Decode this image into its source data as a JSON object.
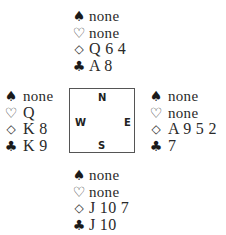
{
  "diagram": {
    "type": "bridge-deal",
    "compass": {
      "north": "N",
      "west": "W",
      "east": "E",
      "south": "S"
    },
    "suit_symbols": {
      "spades": "♠",
      "hearts": "♡",
      "diamonds": "◇",
      "clubs": "♣"
    },
    "hands": {
      "north": {
        "spades": "none",
        "hearts": "none",
        "diamonds": "Q 6 4",
        "clubs": "A 8"
      },
      "west": {
        "spades": "none",
        "hearts": "Q",
        "diamonds": "K 8",
        "clubs": "K 9"
      },
      "east": {
        "spades": "none",
        "hearts": "none",
        "diamonds": "A 9 5 2",
        "clubs": "7"
      },
      "south": {
        "spades": "none",
        "hearts": "none",
        "diamonds": "J 10 7",
        "clubs": "J 10"
      }
    }
  }
}
